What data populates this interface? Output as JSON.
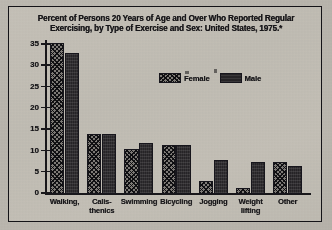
{
  "chart_data": {
    "type": "bar",
    "title": "Percent of Persons 20 Years of Age and Over Who Reported Regular Exercising, by Type of Exercise and Sex: United States, 1975.*",
    "title_line1": "Percent of Persons 20 Years of Age and Over Who Reported Regular",
    "title_line2": "Exercising, by Type of Exercise and Sex: United States, 1975.*",
    "xlabel": "",
    "ylabel": "",
    "ylim": [
      0,
      36
    ],
    "yticks": [
      0,
      5,
      10,
      15,
      20,
      25,
      30,
      35
    ],
    "ytick_labels": [
      "0",
      "5",
      "10",
      "15",
      "20",
      "25",
      "30",
      "35"
    ],
    "grid": false,
    "legend_position": "top-center",
    "categories": [
      "Walking,",
      "Calis-\nthenics",
      "Swimming",
      "Bicycling",
      "Jogging",
      "Weight\nlifting",
      "Other"
    ],
    "category_lines": [
      [
        "Walking,"
      ],
      [
        "Calis-",
        "thenics"
      ],
      [
        "Swimming"
      ],
      [
        "Bicycling"
      ],
      [
        "Jogging"
      ],
      [
        "Weight",
        "lifting"
      ],
      [
        "Other"
      ]
    ],
    "series": [
      {
        "name": "Female",
        "pattern": "cross-hatch",
        "color": "#8d8a88",
        "values": [
          35.5,
          14.0,
          10.5,
          11.5,
          3.0,
          1.5,
          7.5
        ]
      },
      {
        "name": "Male",
        "pattern": "solid-dark",
        "color": "#2a282c",
        "values": [
          33.0,
          14.0,
          12.0,
          11.5,
          8.0,
          7.5,
          6.5
        ]
      }
    ]
  },
  "legend": {
    "entries": [
      {
        "label": "Female",
        "swatch": "female-swatch"
      },
      {
        "label": "Male",
        "swatch": "male-swatch"
      }
    ]
  }
}
